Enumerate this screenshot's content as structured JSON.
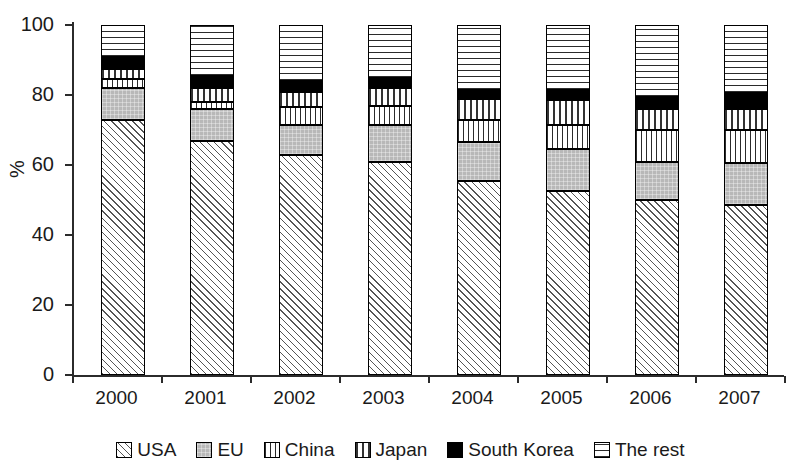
{
  "chart_data": {
    "type": "bar",
    "subtype": "stacked-100-percent",
    "title": "",
    "xlabel": "",
    "ylabel": "%",
    "ylim": [
      0,
      100
    ],
    "yticks": [
      0,
      20,
      40,
      60,
      80,
      100
    ],
    "ytick_labels": [
      "0",
      "20",
      "40",
      "60",
      "80",
      "100"
    ],
    "grid": false,
    "legend_position": "bottom",
    "categories": [
      "2000",
      "2001",
      "2002",
      "2003",
      "2004",
      "2005",
      "2006",
      "2007"
    ],
    "series": [
      {
        "name": "USA",
        "pattern": "diagonal-hatch",
        "color": "#ffffff",
        "values": [
          73,
          67,
          63,
          61,
          55.5,
          52.5,
          50,
          48.5
        ]
      },
      {
        "name": "EU",
        "pattern": "solid-gray",
        "color": "#b8b8b8",
        "values": [
          9,
          9,
          8.5,
          10.5,
          11,
          12,
          11,
          12
        ]
      },
      {
        "name": "China",
        "pattern": "vertical-lines",
        "color": "#ffffff",
        "values": [
          2.5,
          2,
          5,
          5.5,
          6.5,
          7,
          9,
          9.5
        ]
      },
      {
        "name": "Japan",
        "pattern": "dotted-grid",
        "color": "#ffffff",
        "values": [
          3,
          4,
          4.5,
          5,
          6,
          7,
          6,
          6
        ]
      },
      {
        "name": "South Korea",
        "pattern": "solid-black",
        "color": "#000000",
        "values": [
          3.5,
          3.5,
          3,
          3,
          2.5,
          3,
          3.5,
          4.5
        ]
      },
      {
        "name": "The rest",
        "pattern": "horizontal-lines",
        "color": "#ffffff",
        "values": [
          9,
          14.5,
          16,
          15,
          18.5,
          18.5,
          20.5,
          19.5
        ]
      }
    ]
  },
  "axis": {
    "y_title": "%"
  },
  "legend": {
    "items": [
      {
        "label": "USA",
        "swatch": "diagonal-hatch-swatch"
      },
      {
        "label": "EU",
        "swatch": "solid-gray-swatch"
      },
      {
        "label": "China",
        "swatch": "vertical-lines-swatch"
      },
      {
        "label": "Japan",
        "swatch": "dotted-grid-swatch"
      },
      {
        "label": "South Korea",
        "swatch": "solid-black-swatch"
      },
      {
        "label": "The rest",
        "swatch": "horizontal-lines-swatch"
      }
    ]
  }
}
